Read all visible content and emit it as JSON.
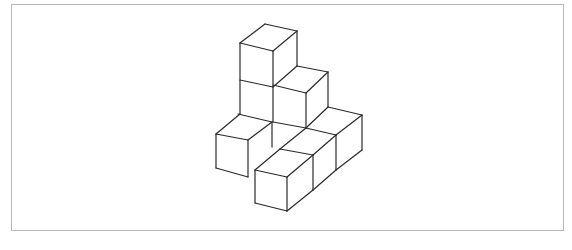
{
  "figure": {
    "cube_count_visible": 8,
    "stroke_color": "#2a2a2a",
    "frame_border_color": "#b8b8b8",
    "background_color": "#ffffff",
    "segments": [
      [
        265,
        24,
        297,
        31
      ],
      [
        240,
        43,
        265,
        24
      ],
      [
        240,
        43,
        273,
        51
      ],
      [
        273,
        51,
        297,
        31
      ],
      [
        297,
        31,
        297,
        66
      ],
      [
        240,
        43,
        240,
        114
      ],
      [
        273,
        51,
        273,
        122
      ],
      [
        240,
        80,
        273,
        87
      ],
      [
        273,
        87,
        297,
        66
      ],
      [
        297,
        66,
        328,
        72
      ],
      [
        273,
        85,
        306,
        93
      ],
      [
        306,
        93,
        328,
        72
      ],
      [
        328,
        72,
        328,
        107
      ],
      [
        306,
        93,
        306,
        128
      ],
      [
        273,
        122,
        306,
        128
      ],
      [
        328,
        107,
        362,
        115
      ],
      [
        306,
        128,
        328,
        107
      ],
      [
        336,
        135,
        362,
        115
      ],
      [
        362,
        115,
        362,
        150
      ],
      [
        336,
        135,
        336,
        170
      ],
      [
        336,
        170,
        362,
        150
      ],
      [
        306,
        128,
        336,
        135
      ],
      [
        240,
        114,
        216,
        134
      ],
      [
        238,
        114,
        272,
        122
      ],
      [
        216,
        134,
        248,
        140
      ],
      [
        248,
        140,
        272,
        122
      ],
      [
        216,
        134,
        216,
        168
      ],
      [
        248,
        140,
        248,
        177
      ],
      [
        216,
        168,
        248,
        177
      ],
      [
        272,
        122,
        272,
        147
      ],
      [
        306,
        128,
        280,
        149
      ],
      [
        280,
        149,
        313,
        155
      ],
      [
        255,
        170,
        280,
        149
      ],
      [
        255,
        170,
        287,
        177
      ],
      [
        287,
        177,
        313,
        155
      ],
      [
        313,
        155,
        336,
        135
      ],
      [
        313,
        155,
        313,
        190
      ],
      [
        255,
        170,
        255,
        203
      ],
      [
        287,
        177,
        287,
        211
      ],
      [
        255,
        203,
        287,
        211
      ],
      [
        287,
        211,
        313,
        190
      ],
      [
        313,
        190,
        336,
        170
      ]
    ]
  }
}
